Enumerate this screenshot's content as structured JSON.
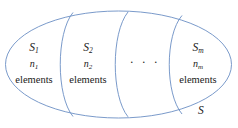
{
  "diagram": {
    "kind": "set-partition-venn",
    "stroke_color": "#6b8fc4",
    "background_color": "#ffffff",
    "text_color": "#1a1a1a",
    "outer_set": {
      "label": "S"
    },
    "dots": "· · ·",
    "compartments": [
      {
        "name": "compartment-1",
        "symbol": "S",
        "symbol_subscript": "1",
        "count": "n",
        "count_subscript": "1",
        "unit": "elements"
      },
      {
        "name": "compartment-2",
        "symbol": "S",
        "symbol_subscript": "2",
        "count": "n",
        "count_subscript": "2",
        "unit": "elements"
      },
      {
        "name": "compartment-m",
        "symbol": "S",
        "symbol_subscript": "m",
        "count": "n",
        "count_subscript": "m",
        "unit": "elements"
      }
    ]
  }
}
